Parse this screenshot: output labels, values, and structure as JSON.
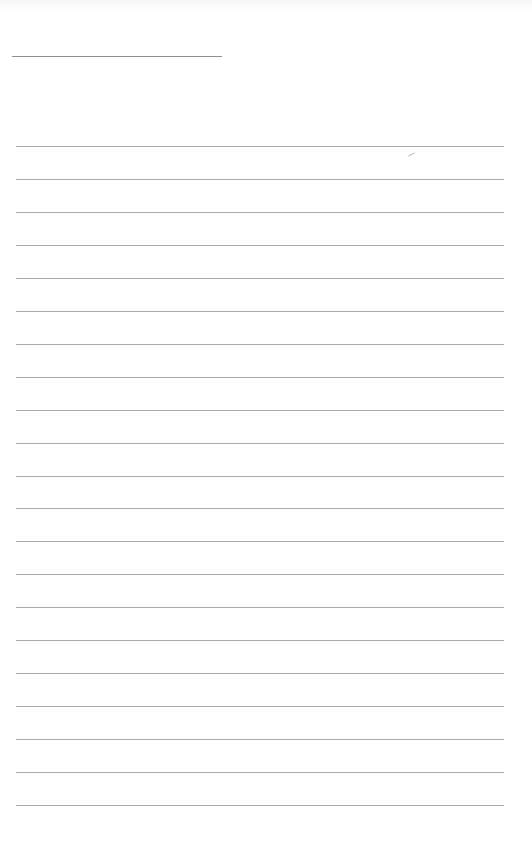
{
  "page": {
    "type": "lined-paper",
    "background_color": "#ffffff",
    "rule_color": "#a9a9a9"
  },
  "header": {
    "name_line": {
      "label": ""
    }
  },
  "ruled_lines": {
    "count": 21,
    "first_y": 146,
    "spacing": 32.95,
    "left_x": 16,
    "right_x": 504
  }
}
